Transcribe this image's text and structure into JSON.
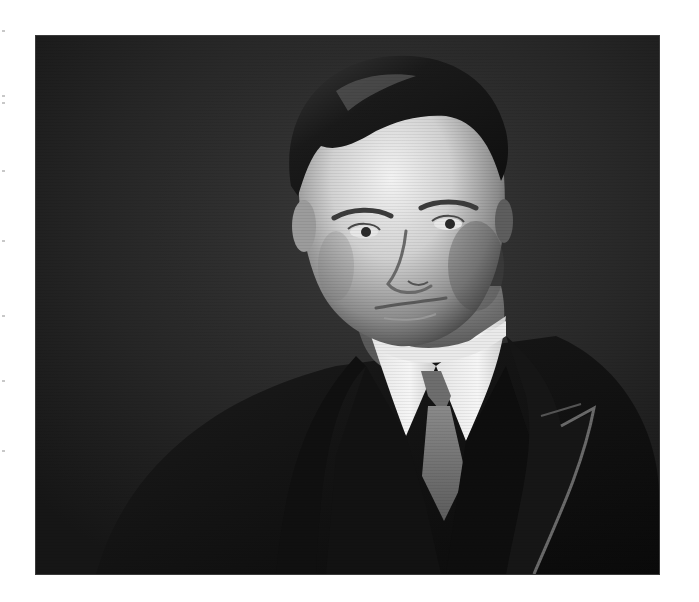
{
  "image": {
    "kind": "photograph",
    "style": "black-and-white vintage studio portrait",
    "subject": "man with side-parted dark hair wearing a white stiff collar, grey tie, dark waistcoat and dark suit jacket with peaked lapel",
    "frame": {
      "x": 36,
      "y": 36,
      "width": 623,
      "height": 538
    },
    "page_background": "#ffffff",
    "backdrop_color": "#2b2b2b",
    "tones": {
      "skin_highlight": "#f2f2f2",
      "skin_mid": "#bdbdbd",
      "skin_shadow": "#6e6e6e",
      "hair": "#1c1c1c",
      "collar": "#f4f4f4",
      "tie": "#7a7a7a",
      "jacket": "#141414",
      "lapel_edge": "#6a6a6a"
    }
  }
}
